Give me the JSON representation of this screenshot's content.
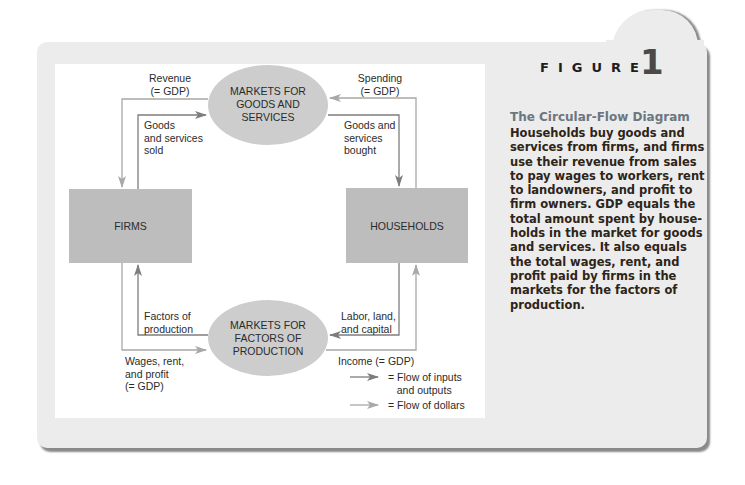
{
  "figure": {
    "label": "FIGURE",
    "number": "1",
    "title": "The Circular-Flow Diagram",
    "caption_lines": [
      "Households buy goods and",
      "services from firms, and firms",
      "use their revenue from sales",
      "to pay wages to workers, rent",
      "to landowners, and profit to",
      "firm owners. GDP equals the",
      "total amount spent by house-",
      "holds in the market for goods",
      "and services. It also equals",
      "the total wages, rent, and",
      "profit paid by firms in the",
      "markets for the factors of",
      "production."
    ]
  },
  "nodes": {
    "goods_market": "MARKETS FOR\nGOODS AND\nSERVICES",
    "factor_market": "MARKETS FOR\nFACTORS OF\nPRODUCTION",
    "firms": "FIRMS",
    "households": "HOUSEHOLDS"
  },
  "flows": {
    "revenue": "Revenue\n(= GDP)",
    "goods_sold": "Goods\nand services\nsold",
    "spending": "Spending\n(= GDP)",
    "goods_bought": "Goods and\nservices\nbought",
    "factors": "Factors of\nproduction",
    "wages": "Wages, rent,\nand profit\n(= GDP)",
    "labor": "Labor, land,\nand capital",
    "income": "Income (= GDP)"
  },
  "legend": {
    "inputs": "= Flow of inputs\n   and outputs",
    "dollars": "= Flow of dollars"
  },
  "colors": {
    "panel": "#ececec",
    "node_fill": "#bdbdbd",
    "dark_flow": "#7d7d7d",
    "light_flow": "#a8a8a8",
    "title": "#6b7680"
  }
}
